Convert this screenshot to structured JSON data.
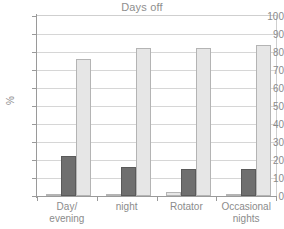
{
  "chart_data": {
    "type": "bar",
    "title": "Days off",
    "xlabel": "",
    "ylabel": "%",
    "ylim": [
      0,
      100
    ],
    "ytick_step": 10,
    "yticks": [
      100,
      90,
      80,
      70,
      60,
      50,
      40,
      30,
      20,
      10,
      0
    ],
    "grid": true,
    "legend": "none",
    "categories": [
      "Day/\nevening",
      "night",
      "Rotator",
      "Occasional\nnights"
    ],
    "category_labels": [
      {
        "line1": "Day/",
        "line2": "evening"
      },
      {
        "line1": "night",
        "line2": ""
      },
      {
        "line1": "Rotator",
        "line2": ""
      },
      {
        "line1": "Occasional",
        "line2": "nights"
      }
    ],
    "series": [
      {
        "name": "series-1",
        "color": "#e6e6e6",
        "values": [
          1,
          1,
          2,
          1
        ]
      },
      {
        "name": "series-2",
        "color": "#6f6f6f",
        "values": [
          22,
          16,
          15,
          15
        ]
      },
      {
        "name": "series-3",
        "color": "#e6e6e6",
        "values": [
          76,
          82,
          82,
          84
        ]
      }
    ]
  },
  "colors": {
    "light_bar": "#e6e6e6",
    "light_bar_border": "#b4b4b4",
    "dark_bar": "#6f6f6f",
    "dark_bar_border": "#5a5a5a",
    "gridline": "#d6d6d6",
    "axis": "#9a9a9a",
    "text": "#8b8b8b",
    "background": "#ffffff"
  }
}
